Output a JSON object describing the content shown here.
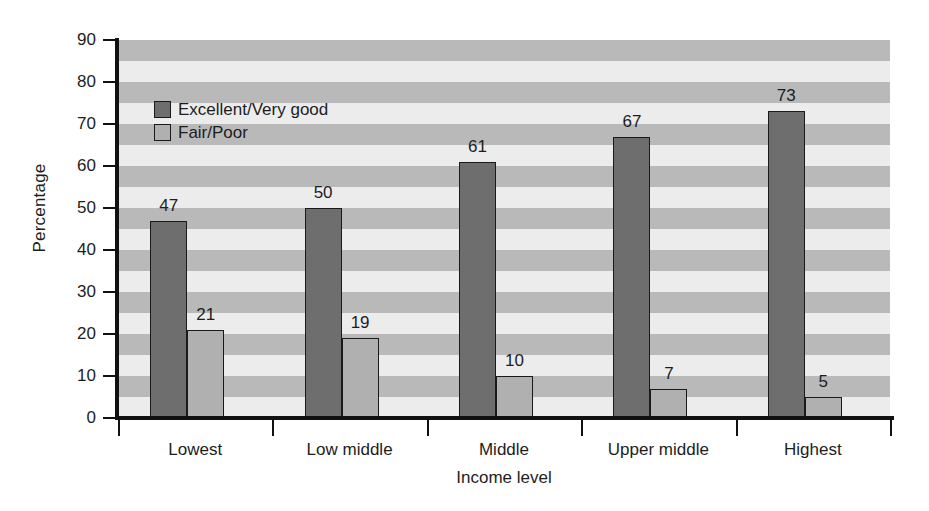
{
  "chart_data": {
    "type": "bar",
    "title": "",
    "subtitle": "",
    "xlabel": "Income level",
    "ylabel": "Percentage",
    "categories": [
      "Lowest",
      "Low middle",
      "Middle",
      "Upper middle",
      "Highest"
    ],
    "series": [
      {
        "name": "Excellent/Very good",
        "values": [
          47,
          50,
          61,
          67,
          73
        ],
        "color": "#6e6e6e"
      },
      {
        "name": "Fair/Poor",
        "values": [
          21,
          19,
          10,
          7,
          5
        ],
        "color": "#b0b0b0"
      }
    ],
    "ylim": [
      0,
      90
    ],
    "ytick_values": [
      0,
      10,
      20,
      30,
      40,
      50,
      60,
      70,
      80,
      90
    ],
    "ytick_labels": [
      "0",
      "10",
      "20",
      "30",
      "40",
      "50",
      "60",
      "70",
      "80",
      "90"
    ],
    "grid": false,
    "background_bands": true,
    "band_interval": 5,
    "band_colors": [
      "#b9b9b9",
      "#ececec"
    ],
    "legend_position": "upper left",
    "data_labels": [
      [
        "47",
        "21"
      ],
      [
        "50",
        "19"
      ],
      [
        "61",
        "10"
      ],
      [
        "67",
        "7"
      ],
      [
        "73",
        "5"
      ]
    ]
  }
}
